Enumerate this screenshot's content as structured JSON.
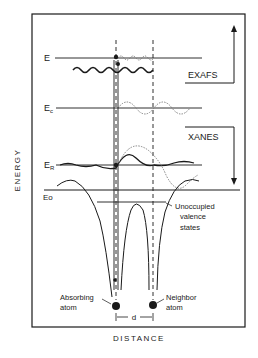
{
  "axes": {
    "y_label": "ENERGY",
    "x_label": "DISTANCE"
  },
  "levels": {
    "E": "E",
    "Ec_main": "E",
    "Ec_sub": "c",
    "ER_main": "E",
    "ER_sub": "R",
    "E0": "Eo"
  },
  "regions": {
    "exafs": "EXAFS",
    "xanes": "XANES"
  },
  "annotations": {
    "unoccupied_line1": "Unoccupied",
    "unoccupied_line2": "valence",
    "unoccupied_line3": "states",
    "absorbing_line1": "Absorbing",
    "absorbing_line2": "atom",
    "neighbor_line1": "Neighbor",
    "neighbor_line2": "atom",
    "distance_d": "d"
  },
  "colors": {
    "ink": "#1a1a1a",
    "dotted": "#777777",
    "background": "#ffffff"
  }
}
